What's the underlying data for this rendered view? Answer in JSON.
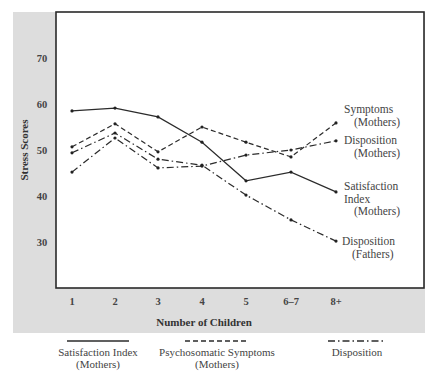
{
  "chart_data": {
    "type": "line",
    "title": "",
    "xlabel": "Number of Children",
    "ylabel": "Stress Scores",
    "categories": [
      "1",
      "2",
      "3",
      "4",
      "5",
      "6–7",
      "8+"
    ],
    "yticks": [
      30,
      40,
      50,
      60,
      70
    ],
    "ylim": [
      20,
      80
    ],
    "grid": false,
    "legend_position": "bottom",
    "series": [
      {
        "name": "Satisfaction Index (Mothers)",
        "style": "solid",
        "values": [
          58.5,
          59.1,
          57.2,
          51.7,
          43.3,
          45.2,
          40.9
        ]
      },
      {
        "name": "Psychosomatic Symptoms (Mothers)",
        "style": "dashed",
        "values": [
          50.7,
          55.7,
          49.6,
          55.0,
          51.7,
          48.5,
          55.9
        ]
      },
      {
        "name": "Disposition (Mothers)",
        "style": "dashdot",
        "values": [
          45.2,
          52.6,
          46.1,
          46.5,
          48.9,
          50.0,
          52.0
        ]
      },
      {
        "name": "Disposition (Fathers)",
        "style": "dashdot",
        "values": [
          49.4,
          53.7,
          48.0,
          46.7,
          40.2,
          34.8,
          30.2
        ]
      }
    ],
    "annotations": [
      {
        "lines": [
          "Symptoms",
          "(Mothers)"
        ],
        "series": "Psychosomatic Symptoms (Mothers)"
      },
      {
        "lines": [
          "Disposition",
          "(Mothers)"
        ],
        "series": "Disposition (Mothers)"
      },
      {
        "lines": [
          "Satisfaction",
          "Index",
          "(Mothers)"
        ],
        "series": "Satisfaction Index (Mothers)"
      },
      {
        "lines": [
          "Disposition",
          "(Fathers)"
        ],
        "series": "Disposition (Fathers)"
      }
    ],
    "legend": [
      {
        "lines": [
          "Satisfaction Index",
          "(Mothers)"
        ],
        "style": "solid"
      },
      {
        "lines": [
          "Psychosomatic Symptoms",
          "(Mothers)"
        ],
        "style": "dashed"
      },
      {
        "lines": [
          "Disposition"
        ],
        "style": "dashdot"
      }
    ]
  },
  "colors": {
    "panel": "#dddddd",
    "plot_background": "#ffffff",
    "line": "#2b2b2b",
    "text": "#444444"
  }
}
